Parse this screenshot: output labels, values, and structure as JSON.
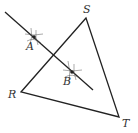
{
  "diagram": {
    "colors": {
      "stroke": "#222222",
      "label": "#333333",
      "background": "#ffffff"
    },
    "vertices": [
      {
        "id": "S",
        "label": "S",
        "x": 86,
        "y": 18,
        "label_x": 83,
        "label_y": 13
      },
      {
        "id": "R",
        "label": "R",
        "x": 21,
        "y": 92,
        "label_x": 8,
        "label_y": 98
      },
      {
        "id": "T",
        "label": "T",
        "x": 119,
        "y": 117,
        "label_x": 122,
        "label_y": 127
      }
    ],
    "points": [
      {
        "id": "A",
        "label": "A",
        "x": 34,
        "y": 37,
        "label_x": 26,
        "label_y": 50
      },
      {
        "id": "B",
        "label": "B",
        "x": 72,
        "y": 72,
        "label_x": 63,
        "label_y": 85
      }
    ],
    "line": {
      "x1": 5,
      "y1": 12,
      "x2": 93,
      "y2": 90
    }
  }
}
